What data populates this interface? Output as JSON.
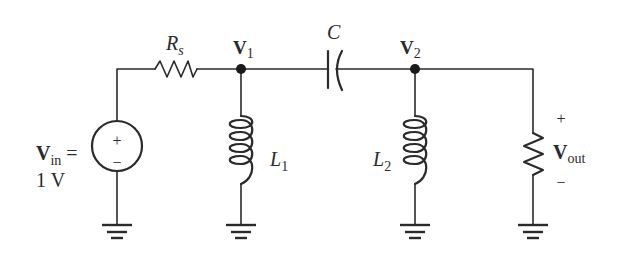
{
  "diagram": {
    "type": "circuit-schematic",
    "components": {
      "source": {
        "label_main": "V",
        "label_sub": "in",
        "label_eq": " =",
        "value": "1 V",
        "plus": "+",
        "minus": "−"
      },
      "rs": {
        "label_main": "R",
        "label_sub": "s"
      },
      "c": {
        "label": "C"
      },
      "l1": {
        "label_main": "L",
        "label_sub": "1"
      },
      "l2": {
        "label_main": "L",
        "label_sub": "2"
      },
      "load": {
        "label_main": "V",
        "label_sub": "out",
        "plus": "+",
        "minus": "−"
      }
    },
    "nodes": {
      "v1": {
        "label_main": "V",
        "label_sub": "1"
      },
      "v2": {
        "label_main": "V",
        "label_sub": "2"
      }
    },
    "colors": {
      "wire": "#2a2a2a",
      "background": "#ffffff"
    }
  }
}
